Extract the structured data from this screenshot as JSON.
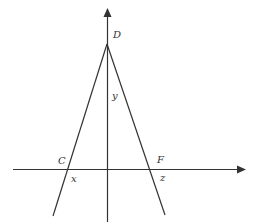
{
  "diagram": {
    "colors": {
      "line": "#333333",
      "background": "#ffffff"
    },
    "labels": {
      "D": "D",
      "y": "y",
      "C": "C",
      "x": "x",
      "F": "F",
      "z": "z"
    }
  }
}
